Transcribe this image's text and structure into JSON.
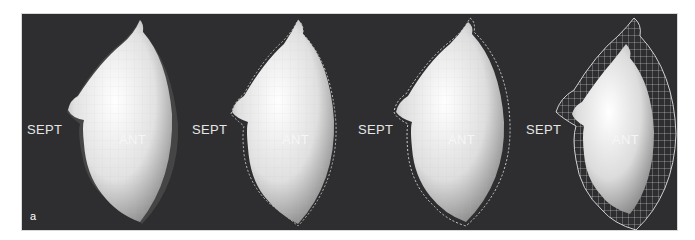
{
  "figure": {
    "panel_label": "a",
    "views": [
      {
        "septal_label": "SEPT",
        "anterior_label": "ANT",
        "wireframe": "inner"
      },
      {
        "septal_label": "SEPT",
        "anterior_label": "ANT",
        "wireframe": "slight"
      },
      {
        "septal_label": "SEPT",
        "anterior_label": "ANT",
        "wireframe": "moderate"
      },
      {
        "septal_label": "SEPT",
        "anterior_label": "ANT",
        "wireframe": "large"
      }
    ],
    "colors": {
      "background": "#2e2e30",
      "surface": "#e8e8e8",
      "label": "#e6e6e6"
    }
  }
}
